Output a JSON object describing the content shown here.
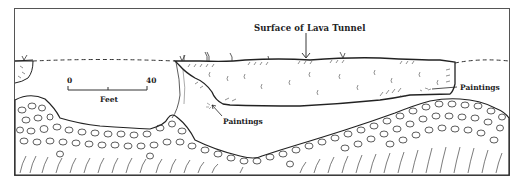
{
  "figure": {
    "type": "cross-section diagram",
    "title_label": "Surface of Lava Tunnel",
    "labels": {
      "paintings_lower": "Paintings",
      "paintings_right": "Paintings"
    },
    "scale_bar": {
      "start": "0",
      "end": "40",
      "unit": "Feet"
    },
    "colors": {
      "ink": "#222222",
      "background": "#ffffff",
      "frame": "#555555"
    }
  }
}
